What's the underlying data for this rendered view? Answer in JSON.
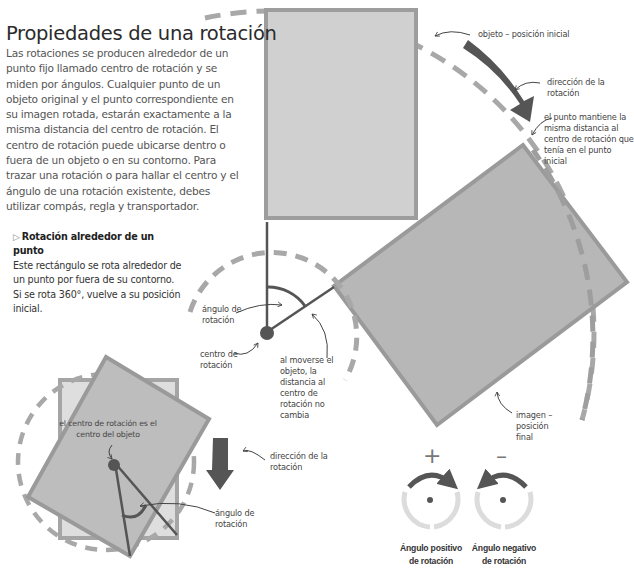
{
  "title": "Propiedades de una rotación",
  "intro": "Las rotaciones se producen alrededor de un punto fijo llamado centro de rotación y se miden por ángulos. Cualquier punto de un objeto original y el punto correspondiente en su imagen rotada, estarán exactamente a la misma distancia del centro de rotación. El centro de rotación puede ubicarse dentro o fuera de un objeto o en su contorno. Para trazar una rotación o para hallar el centro y el ángulo de una rotación existente, debes utilizar compás, regla y transportador.",
  "subsection": {
    "icon": "triangle-right-icon",
    "heading": "Rotación alrededor de un punto",
    "text": "Este rectángulo se rota alrededor de un punto por fuera de su contorno. Si se rota 360°, vuelve a su posición inicial."
  },
  "labels": {
    "initial_object": "objeto – posición inicial",
    "direction_top": "dirección de la rotación",
    "point_same_distance": "el punto mantiene la misma distancia al centro de rotación que tenía en el punto inicial",
    "angle_main": "ángulo de rotación",
    "center_main": "centro de rotación",
    "distance_unchanged": "al moverse el objeto, la distancia al centro de rotación no cambia",
    "image_final": "imagen – posición final",
    "center_is_object_center": "el centro de rotación es el centro del objeto",
    "direction_small": "dirección de la rotación",
    "angle_small": "ángulo de rotación"
  },
  "legend": {
    "positive": {
      "sign": "+",
      "caption": "Ángulo positivo de rotación"
    },
    "negative": {
      "sign": "–",
      "caption": "Ángulo negativo de rotación"
    }
  },
  "colors": {
    "object_fill": "#cfcfcf",
    "object_stroke": "#9a9a9a",
    "image_fill": "#b5b5b5",
    "dashed": "#a8a8a8",
    "dark": "#555555",
    "light_ring": "#dcdcdc"
  }
}
